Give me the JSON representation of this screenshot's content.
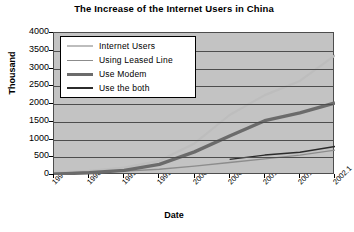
{
  "chart_data": {
    "type": "line",
    "title": "The Increase of the Internet Users in China",
    "xlabel": "Date",
    "ylabel": "Thousand",
    "ylim": [
      0,
      4000
    ],
    "yticks": [
      0,
      500,
      1000,
      1500,
      2000,
      2500,
      3000,
      3500,
      4000
    ],
    "grid": true,
    "legend_position": "upper-left-inside",
    "categories": [
      "1997.10",
      "1998.7",
      "1999.1",
      "1999.7",
      "2000.1",
      "2000.7",
      "2001.1",
      "2001.7",
      "2002.1"
    ],
    "series": [
      {
        "name": "Internet Users",
        "color": "#bdbdbd",
        "width": 2.2,
        "values": [
          62,
          118,
          210,
          400,
          890,
          1690,
          2250,
          2650,
          3370
        ]
      },
      {
        "name": "Using Leased Line",
        "color": "#8c8c8c",
        "width": 1.4,
        "values": [
          49,
          76,
          110,
          160,
          250,
          350,
          454,
          560,
          700
        ]
      },
      {
        "name": "Use Modem",
        "color": "#6b6b6b",
        "width": 3.4,
        "values": [
          25,
          65,
          130,
          300,
          650,
          1100,
          1530,
          1750,
          2030
        ]
      },
      {
        "name": "Use the both",
        "color": "#2b2b2b",
        "width": 1.5,
        "values": [
          null,
          null,
          null,
          null,
          null,
          440,
          560,
          640,
          800
        ]
      }
    ]
  },
  "legend": {
    "items": [
      {
        "label": "Internet Users"
      },
      {
        "label": "Using Leased Line"
      },
      {
        "label": "Use Modem"
      },
      {
        "label": "Use the both"
      }
    ]
  }
}
